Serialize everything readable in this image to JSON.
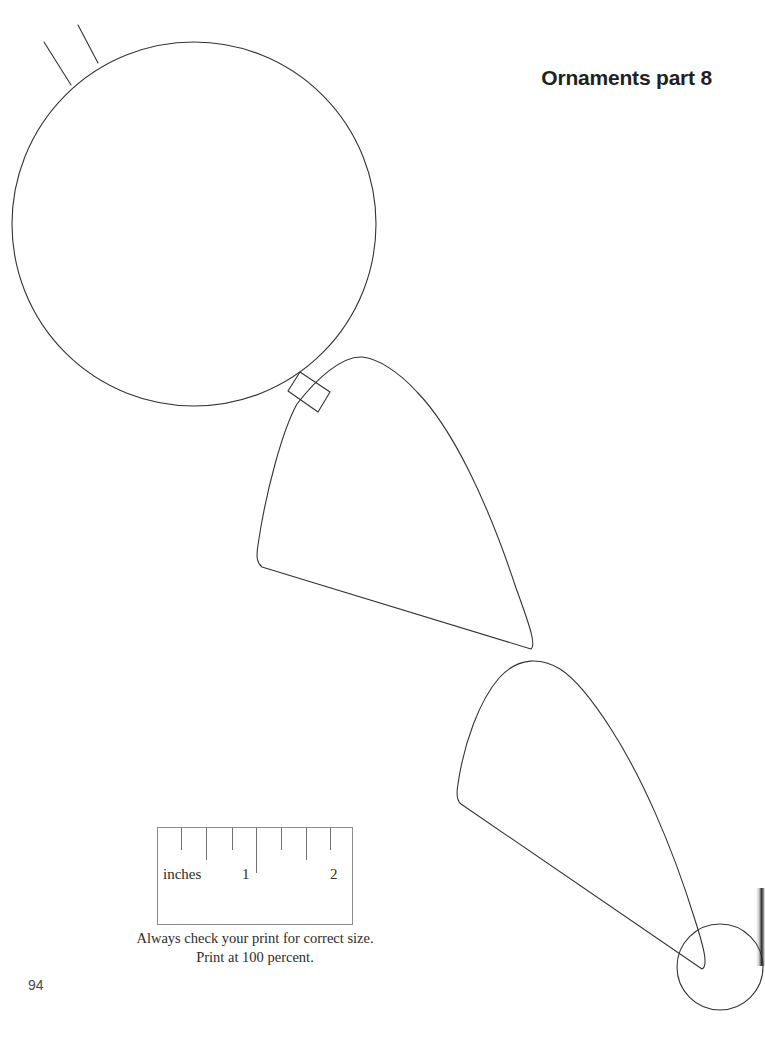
{
  "page": {
    "title": "Ornaments part 8",
    "number": "94",
    "background_color": "#ffffff",
    "line_color": "#333333"
  },
  "ruler": {
    "unit_label": "inches",
    "marks": [
      "1",
      "2"
    ],
    "caption_line1": "Always check your print for correct size.",
    "caption_line2": "Print at 100 percent.",
    "box": {
      "x": 157,
      "y": 827,
      "width": 196,
      "height": 98
    },
    "ticks": [
      {
        "x": 23,
        "height": 22
      },
      {
        "x": 48,
        "height": 32
      },
      {
        "x": 74,
        "height": 22
      },
      {
        "x": 98,
        "height": 45
      },
      {
        "x": 123,
        "height": 22
      },
      {
        "x": 148,
        "height": 32
      },
      {
        "x": 172,
        "height": 22
      }
    ]
  },
  "pattern": {
    "description": "Ornament template outlines: large circle with two radial lines, connector tab, two fan/teardrop panels, small circle",
    "stroke": "#333333",
    "stroke_width": 1.1,
    "fill": "none",
    "shapes": [
      {
        "name": "large-circle",
        "type": "circle",
        "cx": 194,
        "cy": 224,
        "r": 182
      },
      {
        "name": "hanger-line-left",
        "type": "line",
        "x1": 44,
        "y1": 42,
        "x2": 71,
        "y2": 85
      },
      {
        "name": "hanger-line-right",
        "type": "line",
        "x1": 78,
        "y1": 25,
        "x2": 98,
        "y2": 63
      },
      {
        "name": "connector-tab",
        "type": "path",
        "d": "M 288 391 L 300 372 L 330 392 L 318 412 Z"
      },
      {
        "name": "fan-panel-middle",
        "type": "path",
        "d": "M 297 404 C 283 429 266 490 258 545 C 256 557 257 563 262 567 L 531 649 C 536 645 531 629 516 588 C 487 500 452 428 417 392 C 399 372 377 358 362 357 C 342 356 317 378 297 404 Z"
      },
      {
        "name": "fan-panel-lower",
        "type": "path",
        "d": "M 499 678 C 480 700 464 742 458 784 C 456 795 457 801 461 804 L 702 969 C 708 966 705 951 695 920 C 671 842 640 774 611 729 C 595 704 576 679 560 669 C 542 658 519 656 499 678 Z"
      },
      {
        "name": "small-circle",
        "type": "circle",
        "cx": 720,
        "cy": 967,
        "r": 43
      }
    ]
  }
}
